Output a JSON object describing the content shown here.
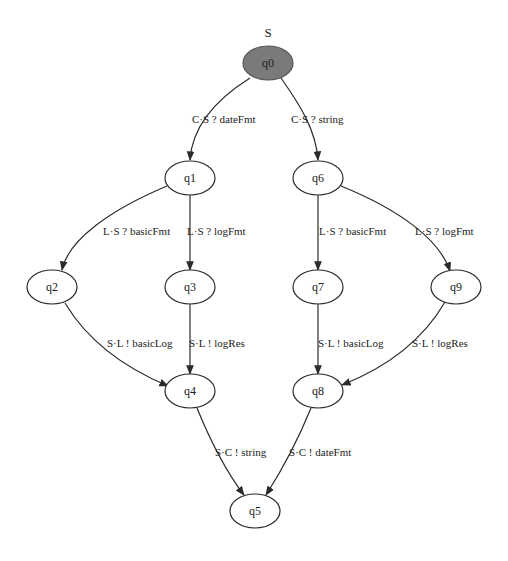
{
  "graph": {
    "title": "S",
    "nodes": [
      {
        "id": "q0",
        "label": "q0",
        "x": 268,
        "y": 63,
        "initial": true
      },
      {
        "id": "q1",
        "label": "q1",
        "x": 190,
        "y": 178
      },
      {
        "id": "q6",
        "label": "q6",
        "x": 318,
        "y": 178
      },
      {
        "id": "q2",
        "label": "q2",
        "x": 52,
        "y": 287
      },
      {
        "id": "q3",
        "label": "q3",
        "x": 190,
        "y": 287
      },
      {
        "id": "q7",
        "label": "q7",
        "x": 318,
        "y": 287
      },
      {
        "id": "q9",
        "label": "q9",
        "x": 456,
        "y": 287
      },
      {
        "id": "q4",
        "label": "q4",
        "x": 190,
        "y": 391
      },
      {
        "id": "q8",
        "label": "q8",
        "x": 318,
        "y": 391
      },
      {
        "id": "q5",
        "label": "q5",
        "x": 255,
        "y": 511
      }
    ],
    "edges": [
      {
        "from": "q0",
        "to": "q1",
        "label": "C·S ? dateFmt"
      },
      {
        "from": "q0",
        "to": "q6",
        "label": "C·S ? string"
      },
      {
        "from": "q1",
        "to": "q2",
        "label": "L·S ? basicFmt"
      },
      {
        "from": "q1",
        "to": "q3",
        "label": "L·S ? logFmt"
      },
      {
        "from": "q6",
        "to": "q7",
        "label": "L·S ? basicFmt"
      },
      {
        "from": "q6",
        "to": "q9",
        "label": "L·S ? logFmt"
      },
      {
        "from": "q2",
        "to": "q4",
        "label": "S·L ! basicLog"
      },
      {
        "from": "q3",
        "to": "q4",
        "label": "S·L ! logRes"
      },
      {
        "from": "q7",
        "to": "q8",
        "label": "S·L ! basicLog"
      },
      {
        "from": "q9",
        "to": "q8",
        "label": "S·L ! logRes"
      },
      {
        "from": "q4",
        "to": "q5",
        "label": "S·C ! string"
      },
      {
        "from": "q8",
        "to": "q5",
        "label": "S·C ! dateFmt"
      }
    ]
  }
}
